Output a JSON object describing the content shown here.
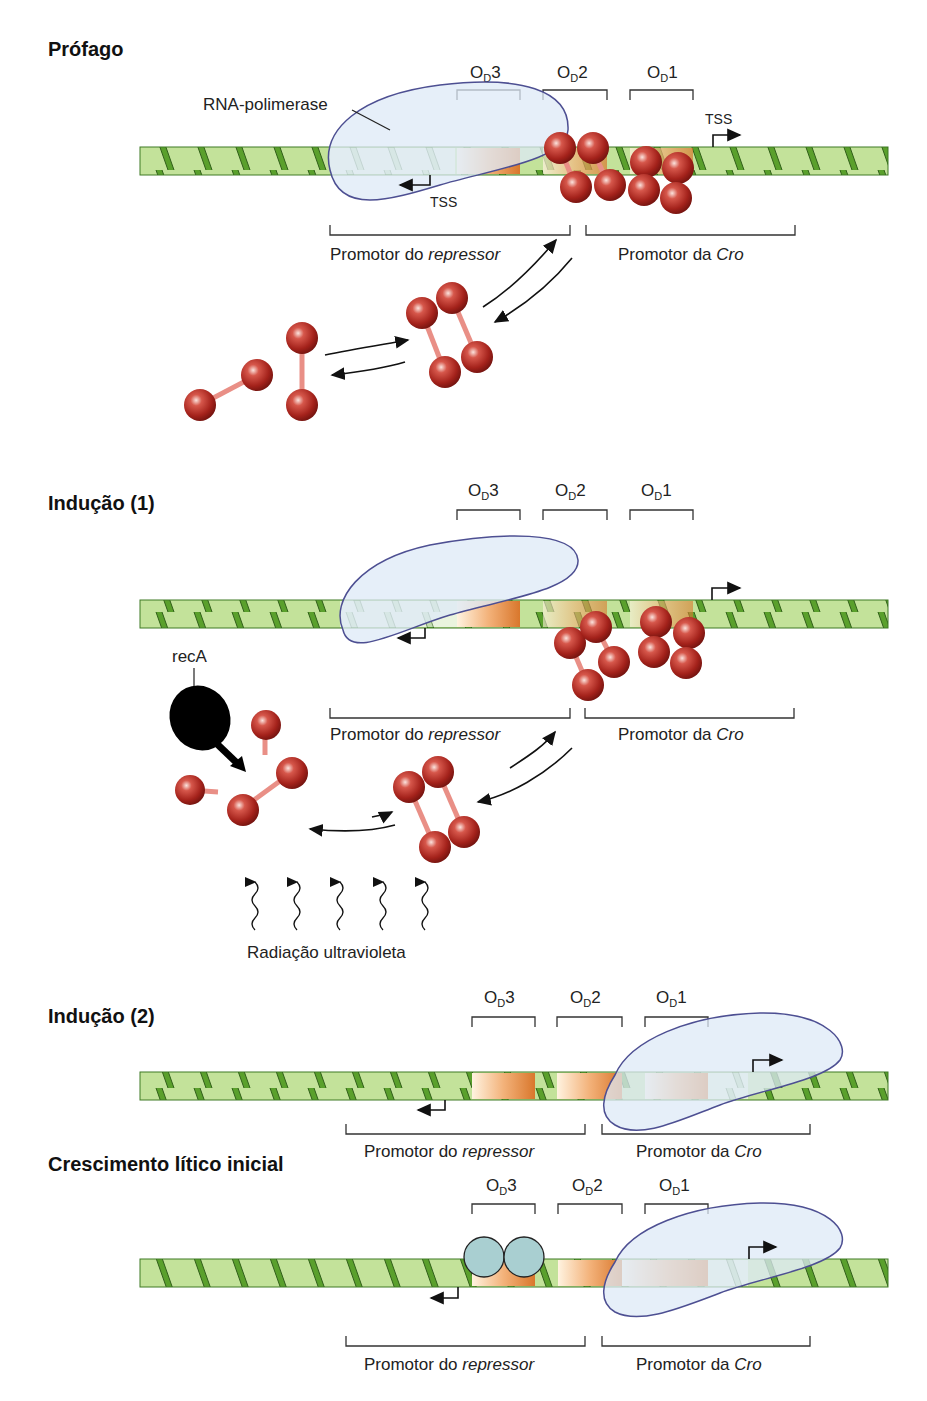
{
  "panels": [
    {
      "id": "profago",
      "title": "Prófago",
      "operators": [
        "O_D3",
        "O_D2",
        "O_D1"
      ],
      "labels": {
        "rna_polymerase": "RNA-polimerase",
        "tss_left": "TSS",
        "tss_right": "TSS",
        "promoter_repressor_prefix": "Promotor do ",
        "promoter_repressor_italic": "repressor",
        "promoter_cro_prefix": "Promotor da ",
        "promoter_cro_italic": "Cro"
      }
    },
    {
      "id": "inducao-1",
      "title": "Indução (1)",
      "operators": [
        "O_D3",
        "O_D2",
        "O_D1"
      ],
      "labels": {
        "reca": "recA",
        "uv": "Radiação ultravioleta",
        "promoter_repressor_prefix": "Promotor do ",
        "promoter_repressor_italic": "repressor",
        "promoter_cro_prefix": "Promotor da ",
        "promoter_cro_italic": "Cro"
      }
    },
    {
      "id": "inducao-2",
      "title": "Indução (2)",
      "operators": [
        "O_D3",
        "O_D2",
        "O_D1"
      ],
      "labels": {
        "promoter_repressor_prefix": "Promotor do ",
        "promoter_repressor_italic": "repressor",
        "promoter_cro_prefix": "Promotor da ",
        "promoter_cro_italic": "Cro"
      }
    },
    {
      "id": "crescimento-litico",
      "title": "Crescimento lítico inicial",
      "operators": [
        "O_D3",
        "O_D2",
        "O_D1"
      ],
      "labels": {
        "promoter_repressor_prefix": "Promotor do ",
        "promoter_repressor_italic": "repressor",
        "promoter_cro_prefix": "Promotor da ",
        "promoter_cro_italic": "Cro"
      }
    }
  ],
  "operator_parts": {
    "O": "O",
    "D": "D",
    "n3": "3",
    "n2": "2",
    "n1": "1"
  },
  "colors": {
    "dna_fill": "#b8dc8c",
    "dna_stripe": "#5aa02c",
    "operator_orange": "#e8934a",
    "repressor_red": "#b1231c",
    "polymerase_fill": "#dde9f7",
    "polymerase_stroke": "#4d4f92",
    "cro_blue": "#a9cfd1",
    "reca_black": "#000000"
  }
}
